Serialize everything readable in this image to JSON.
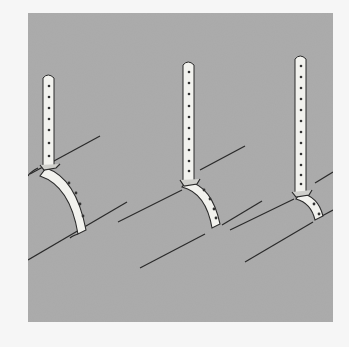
{
  "figure": {
    "background_color": "#a9a9a9",
    "strap_color": "#f4f4f0",
    "line_color": "#2a2a2a",
    "hangers": [
      {
        "name": "large-pipe-hanger",
        "strap_holes": 7,
        "band_holes": 4
      },
      {
        "name": "medium-pipe-hanger",
        "strap_holes": 10,
        "band_holes": 4
      },
      {
        "name": "small-pipe-hanger",
        "strap_holes": 12,
        "band_holes": 2
      }
    ]
  }
}
